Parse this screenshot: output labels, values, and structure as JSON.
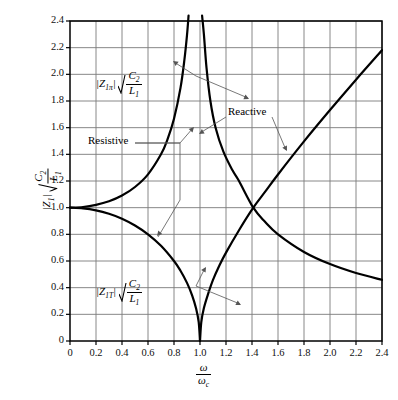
{
  "chart_data": {
    "type": "line",
    "title": "",
    "xlabel": "ω/ωc",
    "ylabel": "|Z1| √(C2/L1)",
    "xlim": [
      0,
      2.4
    ],
    "ylim": [
      0,
      2.4
    ],
    "xticks": [
      "0",
      "0.2",
      "0.4",
      "0.6",
      "0.8",
      "1.0",
      "1.2",
      "1.4",
      "1.6",
      "1.8",
      "2.0",
      "2.2",
      "2.4"
    ],
    "yticks": [
      "0",
      "0.2",
      "0.4",
      "0.6",
      "0.8",
      "1.0",
      "1.2",
      "1.4",
      "1.6",
      "1.8",
      "2.0",
      "2.2",
      "2.4"
    ],
    "grid": true,
    "legend_position": "none",
    "series": [
      {
        "name": "Z1pi resistive branch (0 to 1)",
        "comment": "rises from 1.0 at w=0 to infinity at w=1",
        "points": [
          [
            0,
            1.0
          ],
          [
            0.1,
            1.005
          ],
          [
            0.2,
            1.021
          ],
          [
            0.3,
            1.048
          ],
          [
            0.4,
            1.091
          ],
          [
            0.5,
            1.155
          ],
          [
            0.6,
            1.25
          ],
          [
            0.7,
            1.4
          ],
          [
            0.75,
            1.512
          ],
          [
            0.8,
            1.667
          ],
          [
            0.85,
            1.898
          ],
          [
            0.88,
            2.108
          ],
          [
            0.9,
            2.294
          ],
          [
            0.912,
            2.44
          ]
        ]
      },
      {
        "name": "Z1T resistive branch (0 to 1)",
        "comment": "falls from 1.0 at w=0 to 0 at w=1",
        "points": [
          [
            0,
            1.0
          ],
          [
            0.1,
            0.995
          ],
          [
            0.2,
            0.98
          ],
          [
            0.3,
            0.954
          ],
          [
            0.4,
            0.917
          ],
          [
            0.5,
            0.866
          ],
          [
            0.6,
            0.8
          ],
          [
            0.7,
            0.714
          ],
          [
            0.8,
            0.6
          ],
          [
            0.85,
            0.527
          ],
          [
            0.9,
            0.436
          ],
          [
            0.94,
            0.341
          ],
          [
            0.97,
            0.243
          ],
          [
            0.99,
            0.141
          ],
          [
            1.0,
            0.0
          ]
        ]
      },
      {
        "name": "Z1T reactive branch (>1)",
        "comment": "rises from 0 at w=1 toward 2.2 at w=2.4",
        "points": [
          [
            1.0,
            0.0
          ],
          [
            1.01,
            0.142
          ],
          [
            1.03,
            0.247
          ],
          [
            1.06,
            0.346
          ],
          [
            1.1,
            0.458
          ],
          [
            1.15,
            0.568
          ],
          [
            1.2,
            0.663
          ],
          [
            1.3,
            0.831
          ],
          [
            1.41,
            1.0
          ],
          [
            1.5,
            1.118
          ],
          [
            1.6,
            1.249
          ],
          [
            1.8,
            1.497
          ],
          [
            2.0,
            1.732
          ],
          [
            2.2,
            1.96
          ],
          [
            2.4,
            2.181
          ]
        ]
      },
      {
        "name": "Z1pi reactive branch (>1)",
        "comment": "falls from infinity at w=1 to about 0.45 at w=2.4",
        "points": [
          [
            1.016,
            2.44
          ],
          [
            1.03,
            2.3
          ],
          [
            1.05,
            2.05
          ],
          [
            1.08,
            1.8
          ],
          [
            1.12,
            1.6
          ],
          [
            1.18,
            1.42
          ],
          [
            1.25,
            1.28
          ],
          [
            1.3,
            1.2
          ],
          [
            1.41,
            1.0
          ],
          [
            1.5,
            0.894
          ],
          [
            1.6,
            0.8
          ],
          [
            1.8,
            0.668
          ],
          [
            2.0,
            0.577
          ],
          [
            2.2,
            0.51
          ],
          [
            2.4,
            0.459
          ]
        ]
      }
    ],
    "annotations": [
      {
        "name": "z1pi-label",
        "text": "|Z1π| √(C2/L1)",
        "x": 0.45,
        "y": 2.0
      },
      {
        "name": "z1t-label",
        "text": "|Z1T| √(C2/L1)",
        "x": 0.45,
        "y": 0.45
      },
      {
        "name": "resistive-label",
        "text": "Resistive",
        "x": 0.42,
        "y": 1.48
      },
      {
        "name": "reactive-label",
        "text": "Reactive",
        "x": 1.52,
        "y": 1.82
      }
    ]
  },
  "labels": {
    "resistive": "Resistive",
    "reactive": "Reactive",
    "z_mag_open": "|",
    "z_sym": "Z",
    "z_pi_sub": "1π",
    "z_t_sub": "1T",
    "z_axis_sub": "1",
    "z_mag_close": "|",
    "c2": "C",
    "c2_sub": "2",
    "l1": "L",
    "l1_sub": "1",
    "omega": "ω",
    "omega_c_sub": "c"
  },
  "axes": {
    "xticks": [
      "0",
      "0.2",
      "0.4",
      "0.6",
      "0.8",
      "1.0",
      "1.2",
      "1.4",
      "1.6",
      "1.8",
      "2.0",
      "2.2",
      "2.4"
    ],
    "yticks": [
      "0",
      "0.2",
      "0.4",
      "0.6",
      "0.8",
      "1.0",
      "1.2",
      "1.4",
      "1.6",
      "1.8",
      "2.0",
      "2.2",
      "2.4"
    ]
  },
  "colors": {
    "curve": "#000000",
    "grid": "#7a7a7a",
    "frame": "#000000",
    "background": "#ffffff",
    "leader": "#555555"
  }
}
